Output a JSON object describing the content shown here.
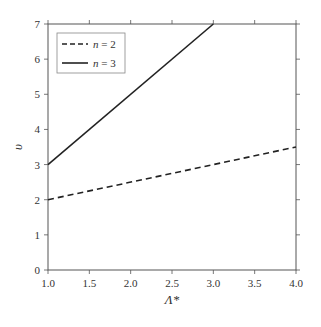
{
  "chart_data": {
    "type": "line",
    "title": "",
    "xlabel": "Λ*",
    "ylabel": "υ",
    "xlim": [
      1.0,
      4.0
    ],
    "ylim": [
      0,
      7
    ],
    "xticks": [
      "1.0",
      "1.5",
      "2.0",
      "2.5",
      "3.0",
      "3.5",
      "4.0"
    ],
    "yticks": [
      "0",
      "1",
      "2",
      "3",
      "4",
      "5",
      "6",
      "7"
    ],
    "grid": false,
    "legend_position": "upper left",
    "series": [
      {
        "name": "n = 2",
        "style": "dashed",
        "color": "#222222",
        "x": [
          1.0,
          4.0
        ],
        "y": [
          2.0,
          3.5
        ]
      },
      {
        "name": "n = 3",
        "style": "solid",
        "color": "#222222",
        "x": [
          1.0,
          3.0
        ],
        "y": [
          3.0,
          7.0
        ]
      }
    ]
  },
  "legend": {
    "items": [
      {
        "var": "n",
        "eq": " = 2"
      },
      {
        "var": "n",
        "eq": " = 3"
      }
    ]
  }
}
